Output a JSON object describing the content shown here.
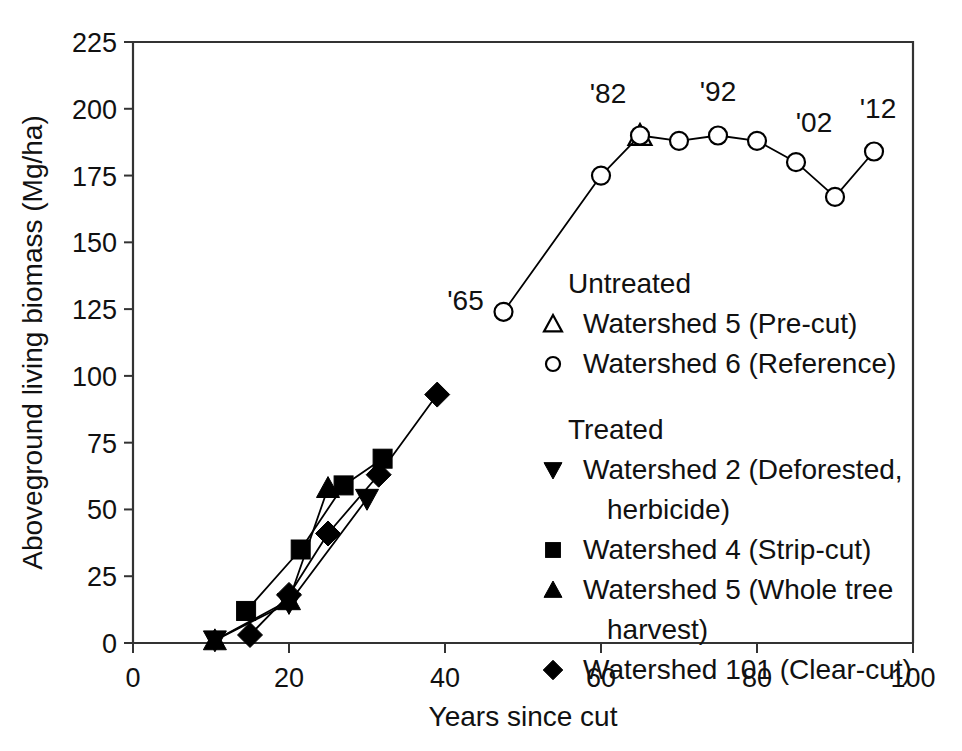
{
  "chart_data": {
    "type": "line",
    "title": "",
    "xlabel": "Years since cut",
    "ylabel": "Aboveground living biomass (Mg/ha)",
    "xlim": [
      0,
      100
    ],
    "ylim": [
      0,
      225
    ],
    "xticks": [
      "0",
      "20",
      "40",
      "60",
      "80",
      "100"
    ],
    "xtick_values": [
      0,
      20,
      40,
      60,
      80,
      100
    ],
    "yticks": [
      "0",
      "25",
      "50",
      "75",
      "100",
      "125",
      "150",
      "175",
      "200",
      "225"
    ],
    "ytick_values": [
      0,
      25,
      50,
      75,
      100,
      125,
      150,
      175,
      200,
      225
    ],
    "grid": false,
    "legend_position": "center-right",
    "series": [
      {
        "name": "Watershed 5 (Pre-cut)",
        "group": "Untreated",
        "marker": "triangle-up-open",
        "x": [
          65
        ],
        "y": [
          190
        ]
      },
      {
        "name": "Watershed 6 (Reference)",
        "group": "Untreated",
        "marker": "circle-open",
        "x": [
          47.5,
          60,
          65,
          70,
          75,
          80,
          85,
          90,
          95
        ],
        "y": [
          124,
          175,
          190,
          188,
          190,
          188,
          180,
          167,
          184
        ]
      },
      {
        "name": "Watershed 2 (Deforested, herbicide)",
        "group": "Treated",
        "marker": "triangle-down-filled",
        "x": [
          10.5,
          20,
          30
        ],
        "y": [
          1,
          15,
          54
        ]
      },
      {
        "name": "Watershed 4 (Strip-cut)",
        "group": "Treated",
        "marker": "square-filled",
        "x": [
          14.5,
          21.5,
          27,
          32
        ],
        "y": [
          12,
          35,
          59,
          69
        ]
      },
      {
        "name": "Watershed 5 (Whole tree harvest)",
        "group": "Treated",
        "marker": "triangle-up-filled",
        "x": [
          10.5,
          20,
          25
        ],
        "y": [
          1,
          16,
          58
        ]
      },
      {
        "name": "Watershed 101 (Clear-cut)",
        "group": "Treated",
        "marker": "diamond-filled",
        "x": [
          15,
          20,
          25,
          31.5,
          39
        ],
        "y": [
          3,
          18,
          41,
          63,
          93
        ]
      }
    ],
    "annotations": [
      {
        "text": "'65",
        "x": 47.5,
        "y": 124,
        "label_dx": -38,
        "label_dy": 6
      },
      {
        "text": "'82",
        "x": 65,
        "y": 190,
        "label_dx": -32,
        "label_dy": -24
      },
      {
        "text": "'92",
        "x": 75,
        "y": 190,
        "label_dx": 0,
        "label_dy": -26
      },
      {
        "text": "'02",
        "x": 85,
        "y": 180,
        "label_dx": 18,
        "label_dy": -22
      },
      {
        "text": "'12",
        "x": 95,
        "y": 184,
        "label_dx": 4,
        "label_dy": -26
      }
    ]
  },
  "legend": {
    "groups": [
      {
        "title": "Untreated",
        "entries": [
          {
            "marker": "triangle-up-open",
            "label": "Watershed 5 (Pre-cut)"
          },
          {
            "marker": "circle-open",
            "label": "Watershed 6 (Reference)"
          }
        ]
      },
      {
        "title": "Treated",
        "entries": [
          {
            "marker": "triangle-down-filled",
            "label": "Watershed 2 (Deforested,",
            "label2": "herbicide)"
          },
          {
            "marker": "square-filled",
            "label": "Watershed 4 (Strip-cut)"
          },
          {
            "marker": "triangle-up-filled",
            "label": "Watershed 5 (Whole tree",
            "label2": "harvest)"
          },
          {
            "marker": "diamond-filled",
            "label": "Watershed 101 (Clear-cut)"
          }
        ]
      }
    ]
  },
  "colors": {
    "axis": "#333333",
    "ink": "#111111",
    "marker_fill": "#000000",
    "background": "#ffffff"
  }
}
